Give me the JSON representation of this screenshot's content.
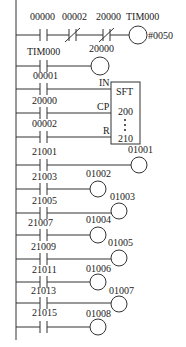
{
  "diagram": {
    "type": "ladder-logic",
    "rung1": {
      "contacts": [
        "00000",
        "00002",
        "20000"
      ],
      "contact_types": [
        "NO",
        "NC",
        "NC"
      ],
      "timer_label": "TIM000",
      "timer_preset": "#0050"
    },
    "rung2": {
      "contact": "TIM000",
      "coil": "20000"
    },
    "sft_block": {
      "name": "SFT",
      "start": "200",
      "end": "210",
      "inputs": [
        {
          "contact": "00001",
          "pin": "IN"
        },
        {
          "contact": "20000",
          "pin": "CP"
        },
        {
          "contact": "00002",
          "pin": "R"
        }
      ]
    },
    "output_rungs": [
      {
        "contact": "21001",
        "coil": "01001"
      },
      {
        "contact": "21003",
        "coil": "01002"
      },
      {
        "contact": "21005",
        "coil": "01003"
      },
      {
        "contact": "21007",
        "coil": "01004"
      },
      {
        "contact": "21009",
        "coil": "01005"
      },
      {
        "contact": "21011",
        "coil": "01006"
      },
      {
        "contact": "21013",
        "coil": "01007"
      },
      {
        "contact": "21015",
        "coil": "01008"
      }
    ]
  }
}
